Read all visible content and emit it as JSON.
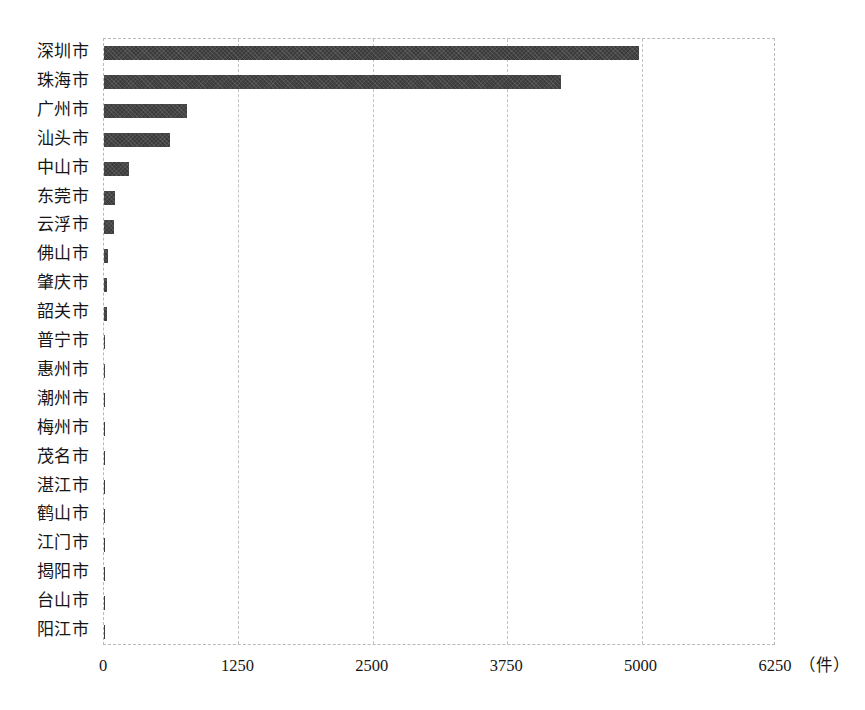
{
  "chart_data": {
    "type": "bar",
    "orientation": "horizontal",
    "title": "",
    "subtitle": "",
    "xlabel": "",
    "ylabel": "",
    "unit_label": "（件）",
    "xlim": [
      0,
      6250
    ],
    "xticks": [
      0,
      1250,
      2500,
      3750,
      5000,
      6250
    ],
    "xtick_labels": [
      "0",
      "1250",
      "2500",
      "3750",
      "5000",
      "6250"
    ],
    "grid": true,
    "legend": false,
    "legend_position": "none",
    "bar_color": "#3c3c3c",
    "categories": [
      "深圳市",
      "珠海市",
      "广州市",
      "汕头市",
      "中山市",
      "东莞市",
      "云浮市",
      "佛山市",
      "肇庆市",
      "韶关市",
      "普宁市",
      "惠州市",
      "潮州市",
      "梅州市",
      "茂名市",
      "湛江市",
      "鹤山市",
      "江门市",
      "揭阳市",
      "台山市",
      "阳江市"
    ],
    "values": [
      4980,
      4250,
      770,
      610,
      235,
      105,
      95,
      40,
      32,
      28,
      12,
      10,
      4,
      3,
      3,
      2,
      2,
      2,
      1,
      1,
      1
    ]
  }
}
